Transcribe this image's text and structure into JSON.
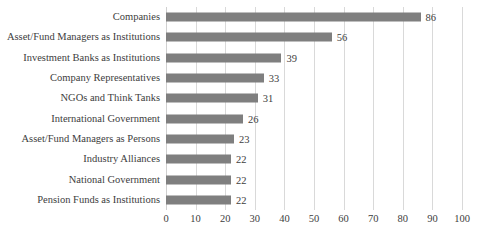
{
  "chart_data": {
    "type": "bar",
    "orientation": "horizontal",
    "title": "",
    "xlabel": "",
    "ylabel": "",
    "xlim": [
      0,
      100
    ],
    "xticks": [
      0,
      10,
      20,
      30,
      40,
      50,
      60,
      70,
      80,
      90,
      100
    ],
    "grid": true,
    "legend": false,
    "bar_color": "#7f7f7f",
    "gridline_color": "#d9d9d9",
    "background_color": "#ffffff",
    "show_value_labels": true,
    "categories": [
      "Companies",
      "Asset/Fund Managers as Institutions",
      "Investment Banks as Institutions",
      "Company Representatives",
      "NGOs and Think Tanks",
      "International Government",
      "Asset/Fund Managers as Persons",
      "Industry Alliances",
      "National Government",
      "Pension Funds as Institutions"
    ],
    "values": [
      86,
      56,
      39,
      33,
      31,
      26,
      23,
      22,
      22,
      22
    ]
  }
}
